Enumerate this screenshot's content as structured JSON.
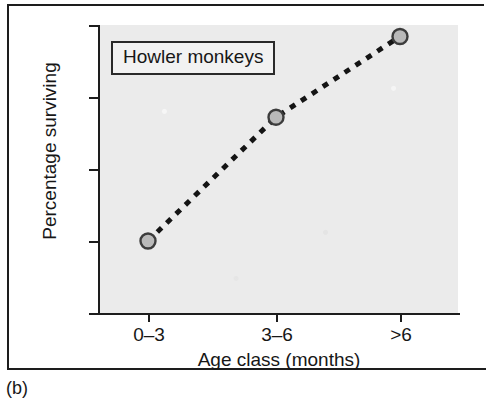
{
  "figure": {
    "caption": "(b)",
    "annotation": "Howler monkeys"
  },
  "chart_data": {
    "type": "line",
    "title": "",
    "subtitle": "",
    "annotations": [
      "Howler monkeys"
    ],
    "categories": [
      "0–3",
      "3–6",
      ">6"
    ],
    "values": [
      25,
      68,
      96
    ],
    "series": [
      {
        "name": "Howler monkeys",
        "values": [
          25,
          68,
          96
        ]
      }
    ],
    "xlabel": "Age class (months)",
    "ylabel": "Percentage surviving",
    "ylim": [
      0,
      100
    ],
    "yticks": [
      0,
      25,
      50,
      75,
      100
    ],
    "ytick_labels": [
      "0",
      "25",
      "50",
      "75",
      "100"
    ],
    "xtick_labels": [
      "0–3",
      "3–6",
      ">6"
    ],
    "grid": false,
    "legend": "none",
    "line_style": "dashed",
    "marker": "circle",
    "colors": {
      "line": "#141414",
      "marker_fill": "#b9b9b9",
      "marker_edge": "#3c3c3c",
      "panel_background": "#ebebeb",
      "axis": "#1d1d1d",
      "text": "#171717"
    }
  }
}
